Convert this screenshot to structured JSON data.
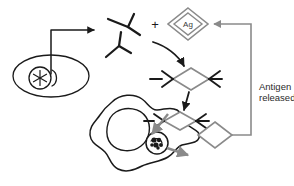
{
  "diagram": {
    "background_color": "#ffffff",
    "stroke_color_primary": "#1a1a1a",
    "stroke_color_secondary": "#8a8a8a",
    "text_color": "#2b2b2b"
  },
  "labels": {
    "antigen_marker": "Ag",
    "plus_sign": "+",
    "antigen_released_line1": "Antigen",
    "antigen_released_line2": "released"
  },
  "elements": {
    "plasma_cell": {
      "name": "plasma-cell",
      "description": "Oval cell with nucleus containing asterisk and crescent organelle"
    },
    "antibodies": {
      "name": "free-antibodies",
      "count": 2,
      "description": "Two Y-shaped antibody molecules"
    },
    "antigen": {
      "name": "antigen-diamond",
      "label": "Ag",
      "description": "Double-outlined gray diamond labeled Ag"
    },
    "complex_upper": {
      "name": "antibody-antigen-complex-upper",
      "description": "Diamond antigen bound by antibody arms on both sides"
    },
    "complex_lower": {
      "name": "antibody-antigen-complex-lower",
      "description": "Second antibody-antigen complex entering macrophage"
    },
    "macrophage": {
      "name": "macrophage",
      "description": "Irregular amoeboid phagocytic cell with nucleus and lysosome"
    },
    "lysosome": {
      "name": "lysosome",
      "description": "Small circle with dark granular contents inside macrophage"
    },
    "released_antigen": {
      "name": "released-antigen-diamond",
      "description": "Gray outlined diamond representing released antigen"
    }
  },
  "arrows": {
    "cell_to_antibodies": {
      "name": "arrow-cell-to-antibodies",
      "color": "#1a1a1a",
      "style": "elbow"
    },
    "binding_curve": {
      "name": "arrow-binding-curve",
      "color": "#1a1a1a",
      "style": "curved"
    },
    "complex_descend": {
      "name": "arrow-complex-descend",
      "color": "#1a1a1a",
      "style": "straight"
    },
    "to_macrophage": {
      "name": "arrow-to-macrophage",
      "color": "#1a1a1a",
      "style": "straight"
    },
    "internalization": {
      "name": "arrow-internalization",
      "color": "#8a8a8a",
      "style": "straight"
    },
    "degradation": {
      "name": "arrow-degradation",
      "color": "#8a8a8a",
      "style": "straight"
    },
    "recycle_feedback": {
      "name": "arrow-recycle-feedback",
      "color": "#8a8a8a",
      "style": "elbow"
    }
  }
}
